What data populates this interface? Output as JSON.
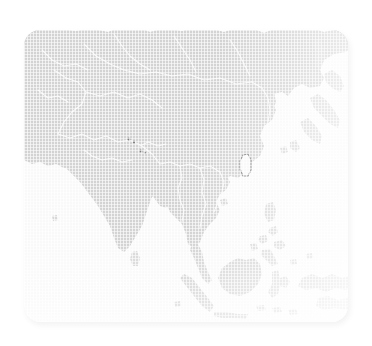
{
  "widget": {
    "name": "asia-pacific-region-map",
    "title": "",
    "description": "Faded grayscale reference map of Asia and the western Pacific on a rounded panel"
  },
  "panel": {
    "corner_radius_px": 16,
    "background_color": "#f6f6f6",
    "shadow": "soft drop shadow, lower-right"
  },
  "colors": {
    "background": "#ffffff",
    "ocean": "#f6f6f6",
    "land_fill": "#bcbcbc",
    "land_fill_soft": "#c4c4c4",
    "country_border": "#f2f2f2",
    "highlight_stroke": "#4a4a4a",
    "marker": "#3c3c3c"
  },
  "map": {
    "projection_extent": "Asia-Pacific",
    "labels_visible": false,
    "graticule_visible": false,
    "texture": "fine woven grid overlay",
    "highlighted_feature": "taiwan-outline",
    "regions": [
      {
        "id": "eurasia-mainland",
        "label": "",
        "fill": "#bcbcbc"
      },
      {
        "id": "india-subcontinent",
        "label": "",
        "fill": "#bcbcbc"
      },
      {
        "id": "indochina",
        "label": "",
        "fill": "#bcbcbc"
      },
      {
        "id": "korean-peninsula",
        "label": "",
        "fill": "#bcbcbc"
      },
      {
        "id": "japan",
        "label": "",
        "fill": "#c4c4c4"
      },
      {
        "id": "taiwan",
        "label": "",
        "fill": "#f4f4f4"
      },
      {
        "id": "philippines",
        "label": "",
        "fill": "#c4c4c4"
      },
      {
        "id": "borneo",
        "label": "",
        "fill": "#bcbcbc"
      },
      {
        "id": "sumatra",
        "label": "",
        "fill": "#bcbcbc"
      },
      {
        "id": "java",
        "label": "",
        "fill": "#bcbcbc"
      },
      {
        "id": "sulawesi",
        "label": "",
        "fill": "#c4c4c4"
      },
      {
        "id": "new-guinea",
        "label": "",
        "fill": "#bcbcbc"
      },
      {
        "id": "sri-lanka",
        "label": "",
        "fill": "#c4c4c4"
      },
      {
        "id": "hainan",
        "label": "",
        "fill": "#c4c4c4"
      },
      {
        "id": "sakhalin",
        "label": "",
        "fill": "#c4c4c4"
      }
    ],
    "markers": [
      {
        "id": "marker-1",
        "x": 129,
        "y": 139
      },
      {
        "id": "marker-2",
        "x": 134,
        "y": 142
      },
      {
        "id": "marker-3",
        "x": 141,
        "y": 151
      },
      {
        "id": "marker-4",
        "x": 145,
        "y": 153
      }
    ]
  }
}
